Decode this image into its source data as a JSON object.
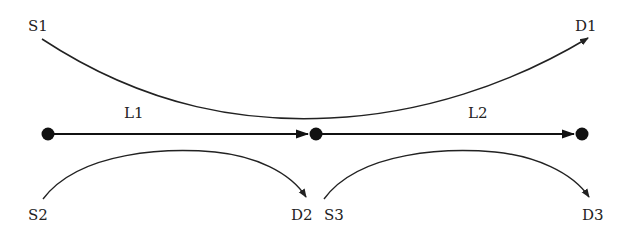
{
  "diagram": {
    "type": "network-flow",
    "colors": {
      "stroke": "#222222",
      "node": "#111111",
      "background": "#ffffff"
    },
    "nodes": [
      {
        "id": "n1",
        "x": 48,
        "y": 134
      },
      {
        "id": "n2",
        "x": 316,
        "y": 134
      },
      {
        "id": "n3",
        "x": 582,
        "y": 134
      }
    ],
    "links": [
      {
        "id": "L1",
        "label": "L1",
        "from": "n1",
        "to": "n2"
      },
      {
        "id": "L2",
        "label": "L2",
        "from": "n2",
        "to": "n3"
      }
    ],
    "flows": [
      {
        "source": "S1",
        "destination": "D1",
        "path": "over L1 and L2"
      },
      {
        "source": "S2",
        "destination": "D2",
        "path": "under L1"
      },
      {
        "source": "S3",
        "destination": "D3",
        "path": "under L2"
      }
    ],
    "labels": {
      "s1": "S1",
      "d1": "D1",
      "l1": "L1",
      "l2": "L2",
      "s2": "S2",
      "d2": "D2",
      "s3": "S3",
      "d3": "D3"
    }
  }
}
